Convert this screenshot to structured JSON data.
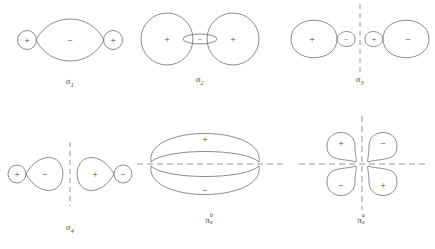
{
  "figure": {
    "title": "",
    "background_color": "#ffffff",
    "stroke_color": "#6e6e6e",
    "node_line_color": "#8c8c8c",
    "text_color": "#4a4a4a"
  },
  "signs": {
    "plus": "+",
    "minus": "−"
  },
  "orbitals": [
    {
      "id": "sigma-1",
      "label_symbol": "σ",
      "label_sub": "1",
      "label_sup": "",
      "description": "two small circular end lobes with a large central lens lobe",
      "nodal_planes": [],
      "lobes": [
        {
          "sign": "+",
          "shape": "small-circle",
          "position": "left"
        },
        {
          "sign": "−",
          "shape": "large-lens",
          "position": "center"
        },
        {
          "sign": "+",
          "shape": "small-circle",
          "position": "right"
        }
      ]
    },
    {
      "id": "sigma-2",
      "label_symbol": "σ",
      "label_sub": "2",
      "label_sup": "",
      "description": "two large circles flanking a thin flat central ellipse",
      "nodal_planes": [],
      "lobes": [
        {
          "sign": "+",
          "shape": "large-circle",
          "position": "left"
        },
        {
          "sign": "−",
          "shape": "flat-ellipse",
          "position": "center"
        },
        {
          "sign": "+",
          "shape": "large-circle",
          "position": "right"
        }
      ]
    },
    {
      "id": "sigma-3",
      "label_symbol": "σ",
      "label_sub": "3",
      "label_sup": "",
      "description": "large lobe with small lobe on each side of a vertical nodal line, antisymmetric",
      "nodal_planes": [
        "vertical"
      ],
      "lobes": [
        {
          "sign": "+",
          "shape": "large-teardrop",
          "position": "far-left"
        },
        {
          "sign": "−",
          "shape": "small-teardrop",
          "position": "inner-left"
        },
        {
          "sign": "+",
          "shape": "small-teardrop",
          "position": "inner-right"
        },
        {
          "sign": "−",
          "shape": "large-teardrop",
          "position": "far-right"
        }
      ]
    },
    {
      "id": "sigma-4",
      "label_symbol": "σ",
      "label_sub": "4",
      "label_sup": "",
      "description": "small circle and large cone lobe mirrored across a vertical nodal line",
      "nodal_planes": [
        "vertical"
      ],
      "lobes": [
        {
          "sign": "+",
          "shape": "small-circle",
          "position": "far-left"
        },
        {
          "sign": "−",
          "shape": "large-cone",
          "position": "inner-left"
        },
        {
          "sign": "+",
          "shape": "large-cone",
          "position": "inner-right"
        },
        {
          "sign": "−",
          "shape": "small-circle",
          "position": "far-right"
        }
      ]
    },
    {
      "id": "pi-x-b",
      "label_symbol": "π",
      "label_sub": "x",
      "label_sup": "b",
      "description": "wide flattened lobe above and below a horizontal nodal line",
      "nodal_planes": [
        "horizontal"
      ],
      "lobes": [
        {
          "sign": "+",
          "shape": "wide-flat-lobe",
          "position": "top"
        },
        {
          "sign": "−",
          "shape": "wide-flat-lobe",
          "position": "bottom"
        }
      ]
    },
    {
      "id": "pi-x-a",
      "label_symbol": "π",
      "label_sub": "x",
      "label_sup": "a",
      "description": "four teardrop lobes in quadrants with horizontal and vertical nodal lines",
      "nodal_planes": [
        "horizontal",
        "vertical"
      ],
      "lobes": [
        {
          "sign": "+",
          "shape": "teardrop",
          "position": "top-left"
        },
        {
          "sign": "−",
          "shape": "teardrop",
          "position": "top-right"
        },
        {
          "sign": "−",
          "shape": "teardrop",
          "position": "bottom-left"
        },
        {
          "sign": "+",
          "shape": "teardrop",
          "position": "bottom-right"
        }
      ]
    }
  ]
}
